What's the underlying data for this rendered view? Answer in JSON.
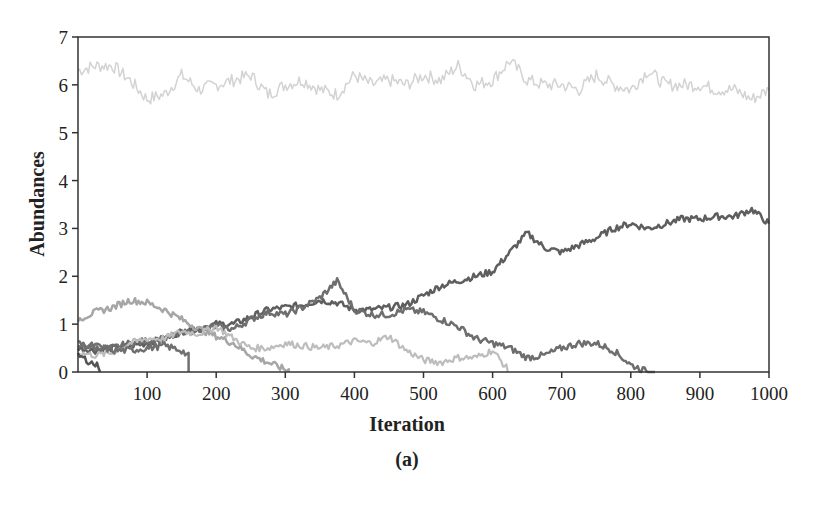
{
  "chart_data": {
    "type": "line",
    "title": "",
    "caption": "(a)",
    "xlabel": "Iteration",
    "ylabel": "Abundances",
    "xlim": [
      0,
      1000
    ],
    "ylim": [
      0,
      7
    ],
    "xticks": [
      100,
      200,
      300,
      400,
      500,
      600,
      700,
      800,
      900,
      1000
    ],
    "yticks": [
      0,
      1,
      2,
      3,
      4,
      5,
      6,
      7
    ],
    "grid": false,
    "legend": null,
    "x": [
      0,
      25,
      50,
      75,
      100,
      125,
      150,
      175,
      200,
      225,
      250,
      275,
      300,
      325,
      350,
      375,
      400,
      425,
      450,
      475,
      500,
      525,
      550,
      575,
      600,
      625,
      650,
      675,
      700,
      725,
      750,
      775,
      800,
      825,
      850,
      875,
      900,
      925,
      950,
      975,
      1000
    ],
    "series": [
      {
        "name": "species-1",
        "color": "#d3d3d3",
        "width": 1.5,
        "values": [
          6.3,
          6.4,
          6.4,
          6.1,
          5.7,
          5.8,
          6.2,
          5.9,
          6.0,
          6.1,
          6.2,
          5.8,
          6.0,
          6.1,
          5.9,
          5.8,
          6.2,
          6.0,
          6.1,
          6.0,
          6.2,
          6.1,
          6.4,
          6.0,
          6.1,
          6.5,
          6.1,
          6.0,
          6.0,
          5.9,
          6.2,
          6.0,
          5.9,
          6.3,
          6.0,
          6.0,
          6.0,
          5.9,
          5.9,
          5.7,
          5.9
        ]
      },
      {
        "name": "species-2",
        "color": "#5e5e5e",
        "width": 2.5,
        "values": [
          0.5,
          0.45,
          0.5,
          0.55,
          0.6,
          0.7,
          0.85,
          0.9,
          1.0,
          1.0,
          1.15,
          1.3,
          1.35,
          1.4,
          1.5,
          1.45,
          1.3,
          1.3,
          1.35,
          1.4,
          1.6,
          1.8,
          1.9,
          2.0,
          2.1,
          2.5,
          2.9,
          2.6,
          2.5,
          2.65,
          2.8,
          3.0,
          3.1,
          3.0,
          3.1,
          3.2,
          3.2,
          3.25,
          3.25,
          3.4,
          3.1
        ]
      },
      {
        "name": "species-3",
        "color": "#6e6e6e",
        "width": 2.5,
        "values": [
          0.6,
          0.5,
          0.5,
          0.6,
          0.65,
          0.7,
          0.8,
          0.9,
          0.95,
          0.9,
          1.1,
          1.25,
          1.2,
          1.35,
          1.55,
          1.9,
          1.3,
          1.2,
          1.2,
          1.3,
          1.25,
          1.1,
          0.95,
          0.7,
          0.6,
          0.5,
          0.3,
          0.35,
          0.5,
          0.6,
          0.6,
          0.45,
          0.15,
          0.0,
          0.0,
          0.0,
          0.0,
          0.0,
          0.0,
          0.0,
          0.0
        ]
      },
      {
        "name": "species-4",
        "color": "#a6a6a6",
        "width": 2.5,
        "values": [
          1.1,
          1.25,
          1.35,
          1.5,
          1.45,
          1.3,
          1.1,
          0.9,
          0.75,
          0.6,
          0.35,
          0.2,
          0.05,
          0.0,
          0.0,
          0.0,
          0.0,
          0.0,
          0.0,
          0.0,
          0.0,
          0.0,
          0.0,
          0.0,
          0.0,
          0.0,
          0.0,
          0.0,
          0.0,
          0.0,
          0.0,
          0.0,
          0.0,
          0.0,
          0.0,
          0.0,
          0.0,
          0.0,
          0.0,
          0.0,
          0.0
        ]
      },
      {
        "name": "species-5",
        "color": "#bdbdbd",
        "width": 2.2,
        "values": [
          0.4,
          0.35,
          0.4,
          0.6,
          0.7,
          0.7,
          0.85,
          0.8,
          0.95,
          0.7,
          0.5,
          0.5,
          0.6,
          0.55,
          0.5,
          0.55,
          0.65,
          0.6,
          0.75,
          0.45,
          0.25,
          0.2,
          0.3,
          0.3,
          0.45,
          0.0,
          0.0,
          0.0,
          0.0,
          0.0,
          0.0,
          0.0,
          0.0,
          0.0,
          0.0,
          0.0,
          0.0,
          0.0,
          0.0,
          0.0,
          0.0
        ]
      },
      {
        "name": "species-6",
        "color": "#707070",
        "width": 2.5,
        "values": [
          0.55,
          0.55,
          0.45,
          0.45,
          0.5,
          0.55,
          0.45,
          0.15,
          0.0,
          0.0,
          0.0,
          0.0,
          0.0,
          0.0,
          0.0,
          0.0,
          0.0,
          0.0,
          0.0,
          0.0,
          0.0,
          0.0,
          0.0,
          0.0,
          0.0,
          0.0,
          0.0,
          0.0,
          0.0,
          0.0,
          0.0,
          0.0,
          0.0,
          0.0,
          0.0,
          0.0,
          0.0,
          0.0,
          0.0,
          0.0,
          0.0
        ]
      },
      {
        "name": "species-7",
        "color": "#555555",
        "width": 2.5,
        "values": [
          0.35,
          0.15,
          0.0,
          0.0,
          0.0,
          0.0,
          0.0,
          0.0,
          0.0,
          0.0,
          0.0,
          0.0,
          0.0,
          0.0,
          0.0,
          0.0,
          0.0,
          0.0,
          0.0,
          0.0,
          0.0,
          0.0,
          0.0,
          0.0,
          0.0,
          0.0,
          0.0,
          0.0,
          0.0,
          0.0,
          0.0,
          0.0,
          0.0,
          0.0,
          0.0,
          0.0,
          0.0,
          0.0,
          0.0,
          0.0,
          0.0
        ]
      }
    ],
    "extinction_points": {
      "species-3": 835,
      "species-4": 305,
      "species-5": 622,
      "species-6": 160,
      "species-7": 32
    }
  },
  "frame": {
    "left": 78,
    "top": 37,
    "right": 769,
    "bottom": 372
  }
}
